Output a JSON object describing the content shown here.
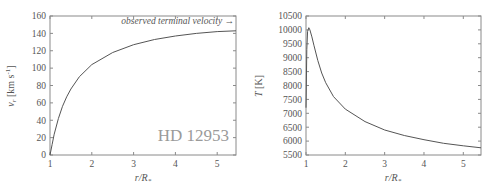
{
  "chart_data": [
    {
      "type": "line",
      "title": "",
      "annotation_star": "HD 12953",
      "annotation_terminal": "observed terminal velocity →",
      "xlabel": "r/R*",
      "ylabel": "v_r [km s^-1]",
      "xlim": [
        1,
        5.45
      ],
      "ylim": [
        0,
        160
      ],
      "xticks": [
        "1",
        "2",
        "3",
        "4",
        "5"
      ],
      "yticks": [
        "0",
        "20",
        "40",
        "60",
        "80",
        "100",
        "120",
        "140",
        "160"
      ],
      "grid": false,
      "series": [
        {
          "name": "velocity",
          "x": [
            1.0,
            1.05,
            1.1,
            1.2,
            1.3,
            1.4,
            1.5,
            1.7,
            2.0,
            2.5,
            3.0,
            3.5,
            4.0,
            4.5,
            5.0,
            5.45
          ],
          "y": [
            0,
            12,
            24,
            42,
            56,
            67,
            76,
            90,
            104,
            118,
            127,
            133,
            137,
            140,
            142,
            143
          ]
        }
      ]
    },
    {
      "type": "line",
      "title": "",
      "xlabel": "r/R*",
      "ylabel": "T [K]",
      "xlim": [
        1,
        5.45
      ],
      "ylim": [
        5500,
        10500
      ],
      "xticks": [
        "1",
        "2",
        "3",
        "4",
        "5"
      ],
      "yticks": [
        "5500",
        "6000",
        "6500",
        "7000",
        "7500",
        "8000",
        "8500",
        "9000",
        "9500",
        "10000",
        "10500"
      ],
      "grid": false,
      "series": [
        {
          "name": "temperature",
          "x": [
            1.0,
            1.02,
            1.04,
            1.07,
            1.1,
            1.15,
            1.2,
            1.3,
            1.4,
            1.5,
            1.7,
            2.0,
            2.5,
            3.0,
            3.5,
            4.0,
            4.5,
            5.0,
            5.45
          ],
          "y": [
            7200,
            9300,
            9950,
            10080,
            10000,
            9750,
            9450,
            8900,
            8450,
            8100,
            7600,
            7150,
            6700,
            6400,
            6200,
            6050,
            5920,
            5830,
            5760
          ]
        }
      ]
    }
  ],
  "left_chart": {
    "yticks": [
      "0",
      "20",
      "40",
      "60",
      "80",
      "100",
      "120",
      "140",
      "160"
    ],
    "xticks": [
      "1",
      "2",
      "3",
      "4",
      "5"
    ],
    "ylabel": "v",
    "ylabel_sub": "r",
    "ylabel_unit": " [km s",
    "ylabel_exp": "-1",
    "ylabel_close": "]",
    "xlabel_r": "r/R",
    "xlabel_sub": "*",
    "annotation_terminal": "observed terminal velocity →",
    "annotation_star": "HD 12953"
  },
  "right_chart": {
    "yticks": [
      "5500",
      "6000",
      "6500",
      "7000",
      "7500",
      "8000",
      "8500",
      "9000",
      "9500",
      "10000",
      "10500"
    ],
    "xticks": [
      "1",
      "2",
      "3",
      "4",
      "5"
    ],
    "ylabel_T": "T",
    "ylabel_unit": " [K]",
    "xlabel_r": "r/R",
    "xlabel_sub": "*"
  }
}
